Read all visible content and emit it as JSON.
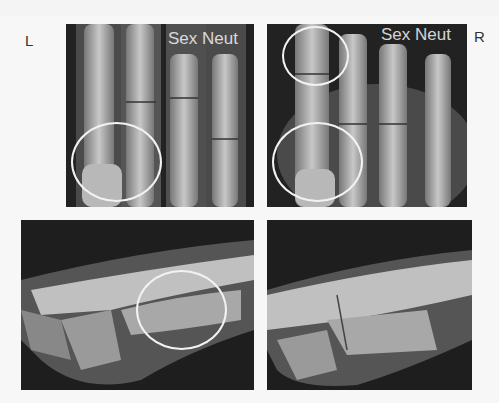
{
  "figure": {
    "labels": {
      "left": "L",
      "right": "R"
    },
    "panels": [
      {
        "id": "top-left",
        "view": "dorsopalmar",
        "side": "left",
        "overlay_text": "Sex Neut",
        "circles": 1
      },
      {
        "id": "top-right",
        "view": "dorsopalmar",
        "side": "right",
        "overlay_text": "Sex Neut",
        "circles": 2
      },
      {
        "id": "bottom-left",
        "view": "lateral",
        "side": "left",
        "circles": 1
      },
      {
        "id": "bottom-right",
        "view": "lateral",
        "side": "right",
        "circles": 0
      }
    ],
    "colors": {
      "background": "#f7f7f7",
      "annotation": "#f2f2f2",
      "film": "#1a1a1a"
    }
  }
}
